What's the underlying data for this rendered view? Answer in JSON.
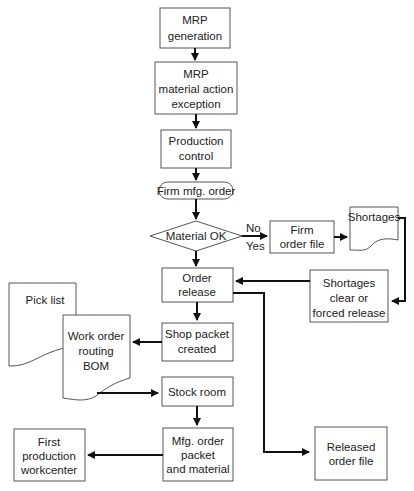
{
  "nodes": {
    "mrp_generation": [
      "MRP",
      "generation"
    ],
    "mrp_exception": [
      "MRP",
      "material action",
      "exception"
    ],
    "production_control": [
      "Production",
      "control"
    ],
    "firm_mfg_order": "Firm mfg. order",
    "material_ok": "Material OK",
    "firm_order_file": [
      "Firm",
      "order file"
    ],
    "shortages": "Shortages",
    "shortages_clear": [
      "Shortages",
      "clear or",
      "forced release"
    ],
    "order_release": [
      "Order",
      "release"
    ],
    "pick_list": "Pick list",
    "work_order": [
      "Work order",
      "routing",
      "BOM"
    ],
    "shop_packet": [
      "Shop packet",
      "created"
    ],
    "stock_room": "Stock room",
    "mfg_order_packet": [
      "Mfg. order",
      "packet",
      "and material"
    ],
    "first_production": [
      "First",
      "production",
      "workcenter"
    ],
    "released_order_file": [
      "Released",
      "order file"
    ]
  },
  "labels": {
    "no": "No",
    "yes": "Yes"
  }
}
